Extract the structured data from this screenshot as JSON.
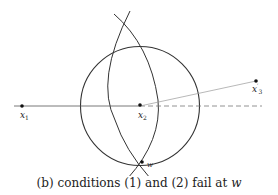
{
  "figure": {
    "points": {
      "x1": {
        "name": "x",
        "sub": "1",
        "prime": ""
      },
      "x2": {
        "name": "x",
        "sub": "2",
        "prime": ""
      },
      "x3p": {
        "name": "x",
        "sub": "3",
        "prime": "′"
      },
      "w": {
        "name": "w"
      }
    },
    "caption": {
      "prefix": "(b) conditions (1) and (2) fail at ",
      "var": "w"
    }
  }
}
